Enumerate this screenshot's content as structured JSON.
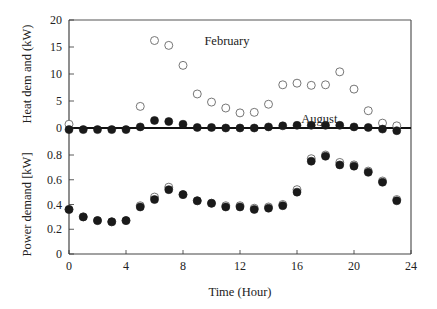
{
  "chart_data": {
    "type": "scatter",
    "title": "",
    "xlabel": "Time (Hour)",
    "x": [
      0,
      1,
      2,
      3,
      4,
      5,
      6,
      7,
      8,
      9,
      10,
      11,
      12,
      13,
      14,
      15,
      16,
      17,
      18,
      19,
      20,
      21,
      22,
      23
    ],
    "xlim": [
      0,
      24
    ],
    "xticks": [
      0,
      4,
      8,
      12,
      16,
      20,
      24
    ],
    "panels": [
      {
        "name": "heat",
        "ylabel": "Heat dem and (kW)",
        "ylim": [
          0,
          20
        ],
        "yticks": [
          0,
          5,
          10,
          15,
          20
        ],
        "annotations": [
          {
            "text": "February",
            "x": 9.5,
            "y": 16.2
          },
          {
            "text": "August",
            "x": 16.3,
            "y": 1.6
          }
        ],
        "series": [
          {
            "name": "February",
            "marker": "open-circle",
            "values": [
              0.7,
              null,
              null,
              null,
              null,
              4.0,
              16.2,
              15.3,
              11.6,
              6.3,
              4.8,
              3.7,
              2.8,
              2.9,
              4.4,
              8.0,
              8.3,
              7.9,
              8.0,
              10.4,
              7.2,
              3.2,
              0.9,
              0.4
            ]
          },
          {
            "name": "August",
            "marker": "filled-circle",
            "values": [
              -0.3,
              -0.3,
              -0.3,
              -0.3,
              -0.3,
              0.2,
              1.4,
              1.2,
              0.7,
              0.1,
              0.1,
              0.0,
              0.0,
              0.0,
              0.2,
              0.4,
              0.5,
              0.5,
              0.5,
              0.5,
              0.2,
              0.1,
              -0.2,
              -0.5
            ]
          }
        ]
      },
      {
        "name": "power",
        "ylabel": "Power demand [kW]",
        "ylim": [
          0,
          0.8
        ],
        "yticks": [
          0,
          0.2,
          0.4,
          0.6,
          0.8
        ],
        "series": [
          {
            "name": "February",
            "marker": "open-circle",
            "values": [
              0.36,
              0.3,
              0.27,
              0.26,
              0.27,
              0.39,
              0.46,
              0.54,
              0.48,
              0.43,
              0.41,
              0.39,
              0.39,
              0.37,
              0.38,
              0.4,
              0.52,
              0.77,
              0.8,
              0.74,
              0.72,
              0.67,
              0.59,
              0.44
            ]
          },
          {
            "name": "August",
            "marker": "filled-circle",
            "values": [
              0.36,
              0.3,
              0.27,
              0.26,
              0.27,
              0.38,
              0.44,
              0.52,
              0.48,
              0.43,
              0.41,
              0.38,
              0.38,
              0.36,
              0.37,
              0.39,
              0.5,
              0.75,
              0.79,
              0.72,
              0.71,
              0.66,
              0.58,
              0.43
            ]
          }
        ]
      }
    ]
  }
}
